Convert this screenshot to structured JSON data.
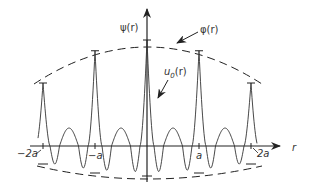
{
  "diagram": {
    "labels": {
      "y_axis": "ψ(r)",
      "x_axis": "r",
      "envelope": "φ(r)",
      "periodic": "u0(r)",
      "periodic_main": "u",
      "periodic_sub": "0",
      "periodic_arg": "(r)"
    },
    "ticks": [
      {
        "label": "−2a",
        "position": -2
      },
      {
        "label": "−a",
        "position": -1
      },
      {
        "label": "a",
        "position": 1
      },
      {
        "label": "2a",
        "position": 2
      }
    ],
    "peak_positions": [
      -2,
      -1,
      0,
      1,
      2
    ],
    "colors": {
      "ink": "#222222",
      "background": "#ffffff"
    }
  }
}
